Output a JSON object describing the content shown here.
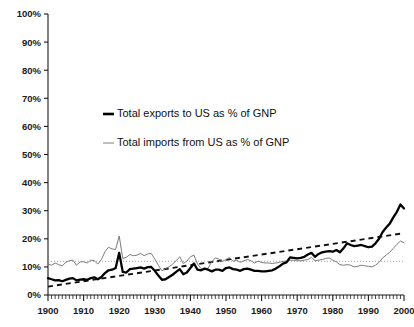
{
  "chart_data": {
    "type": "line",
    "title": "",
    "subtitle": "",
    "xlabel": "",
    "ylabel": "",
    "xlim": [
      1900,
      2000
    ],
    "ylim": [
      0,
      100
    ],
    "ytick_step": 10,
    "xtick_step": 10,
    "minor_xticks_per_decade": 10,
    "grid": false,
    "legend_position": "upper-center-left",
    "ytick_labels": [
      "0%",
      "10%",
      "20%",
      "30%",
      "40%",
      "50%",
      "60%",
      "70%",
      "80%",
      "90%",
      "100%"
    ],
    "ytick_values": [
      0,
      10,
      20,
      30,
      40,
      50,
      60,
      70,
      80,
      90,
      100
    ],
    "xtick_labels": [
      "1900",
      "1910",
      "1920",
      "1930",
      "1940",
      "1950",
      "1960",
      "1970",
      "1980",
      "1990",
      "2000"
    ],
    "xtick_values": [
      1900,
      1910,
      1920,
      1930,
      1940,
      1950,
      1960,
      1970,
      1980,
      1990,
      2000
    ],
    "x": [
      1900,
      1901,
      1902,
      1903,
      1904,
      1905,
      1906,
      1907,
      1908,
      1909,
      1910,
      1911,
      1912,
      1913,
      1914,
      1915,
      1916,
      1917,
      1918,
      1919,
      1920,
      1921,
      1922,
      1923,
      1924,
      1925,
      1926,
      1927,
      1928,
      1929,
      1930,
      1931,
      1932,
      1933,
      1934,
      1935,
      1936,
      1937,
      1938,
      1939,
      1940,
      1941,
      1942,
      1943,
      1944,
      1945,
      1946,
      1947,
      1948,
      1949,
      1950,
      1951,
      1952,
      1953,
      1954,
      1955,
      1956,
      1957,
      1958,
      1959,
      1960,
      1961,
      1962,
      1963,
      1964,
      1965,
      1966,
      1967,
      1968,
      1969,
      1970,
      1971,
      1972,
      1973,
      1974,
      1975,
      1976,
      1977,
      1978,
      1979,
      1980,
      1981,
      1982,
      1983,
      1984,
      1985,
      1986,
      1987,
      1988,
      1989,
      1990,
      1991,
      1992,
      1993,
      1994,
      1995,
      1996,
      1997,
      1998,
      1999,
      2000
    ],
    "series": [
      {
        "name": "Total exports to US as % of GNP",
        "style": "solid-bold",
        "color": "#000000",
        "values": [
          6.0,
          5.6,
          5.2,
          5.3,
          4.9,
          5.4,
          5.8,
          6.0,
          5.2,
          5.5,
          5.6,
          5.4,
          6.0,
          6.3,
          5.6,
          6.4,
          7.8,
          8.8,
          9.0,
          9.6,
          15.0,
          8.2,
          8.0,
          9.2,
          9.4,
          9.6,
          9.8,
          9.4,
          9.9,
          10.0,
          8.6,
          6.9,
          5.4,
          5.6,
          6.4,
          7.2,
          8.2,
          9.2,
          7.4,
          8.0,
          9.6,
          11.2,
          9.0,
          8.8,
          9.4,
          9.0,
          8.4,
          9.0,
          9.0,
          8.6,
          9.6,
          9.8,
          9.2,
          9.0,
          8.6,
          9.2,
          9.4,
          9.0,
          8.6,
          8.6,
          8.4,
          8.4,
          8.6,
          8.8,
          9.4,
          10.2,
          11.2,
          11.6,
          13.4,
          13.2,
          13.0,
          13.2,
          13.6,
          14.4,
          15.0,
          13.6,
          14.6,
          15.2,
          15.4,
          15.6,
          15.4,
          16.0,
          15.2,
          16.6,
          18.4,
          17.8,
          17.4,
          17.6,
          17.8,
          17.4,
          17.0,
          17.2,
          18.4,
          20.0,
          22.4,
          24.0,
          25.4,
          27.6,
          29.6,
          32.2,
          30.8
        ]
      },
      {
        "name": "Total imports from US as % of GNP",
        "style": "solid-thin",
        "color": "#7c7c7c",
        "values": [
          11.0,
          10.6,
          11.4,
          10.8,
          10.4,
          11.6,
          12.2,
          12.4,
          10.6,
          11.8,
          11.8,
          11.4,
          12.4,
          12.2,
          11.0,
          12.6,
          15.4,
          17.0,
          16.4,
          16.2,
          21.0,
          13.0,
          13.4,
          14.4,
          14.0,
          14.2,
          14.8,
          14.0,
          14.6,
          14.8,
          12.8,
          10.6,
          8.6,
          9.4,
          10.0,
          11.0,
          12.2,
          13.6,
          11.2,
          12.0,
          13.6,
          14.2,
          11.0,
          9.4,
          9.0,
          9.6,
          11.8,
          13.2,
          12.8,
          12.0,
          12.6,
          13.4,
          12.0,
          12.4,
          11.6,
          12.2,
          12.6,
          12.2,
          11.4,
          12.0,
          11.6,
          11.4,
          11.4,
          11.2,
          11.4,
          11.6,
          12.0,
          12.0,
          12.4,
          12.4,
          12.2,
          12.2,
          12.4,
          12.6,
          13.4,
          12.2,
          12.4,
          12.6,
          13.0,
          13.2,
          12.4,
          11.8,
          10.8,
          10.6,
          10.8,
          10.6,
          10.0,
          10.2,
          10.6,
          10.4,
          10.2,
          10.0,
          10.6,
          11.6,
          13.2,
          14.2,
          15.2,
          16.6,
          18.0,
          19.2,
          18.6
        ]
      }
    ],
    "annotations": [
      {
        "name": "exports-trend-line",
        "type": "dashed-trend",
        "from": [
          1900,
          3.0
        ],
        "to": [
          2000,
          22.0
        ]
      },
      {
        "name": "reference-line-12pct",
        "type": "dotted-horizontal",
        "value": 12.0,
        "from_x": 1900,
        "to_x": 2000
      }
    ]
  },
  "legend": {
    "entries": [
      {
        "label": "Total exports to US as % of GNP",
        "swatch": "bold-dash-swatch"
      },
      {
        "label": "Total imports from US as % of GNP",
        "swatch": "thin-dash-swatch"
      }
    ]
  }
}
